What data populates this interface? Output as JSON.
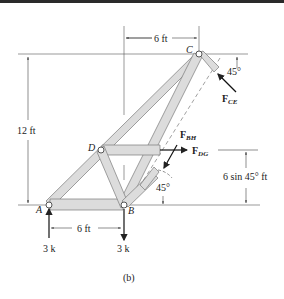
{
  "figure": {
    "caption": "(b)",
    "joints": {
      "A": "A",
      "B": "B",
      "C": "C",
      "D": "D"
    },
    "dimensions": {
      "top_width": "6 ft",
      "height": "12 ft",
      "bottom_width": "6 ft",
      "cut_height": "6 sin 45° ft"
    },
    "angles": {
      "top": "45°",
      "bottom": "45°"
    },
    "forces": {
      "FCE": {
        "main": "F",
        "sub": "CE"
      },
      "FBH": {
        "main": "F",
        "sub": "BH"
      },
      "FDG": {
        "main": "F",
        "sub": "DG"
      }
    },
    "loads": {
      "A": "3 k",
      "B": "3 k"
    }
  },
  "colors": {
    "member_fill": "#dcdcdc",
    "member_stroke": "#7a7a7a",
    "line": "#333333",
    "top_bar": "#2a2a2a"
  }
}
